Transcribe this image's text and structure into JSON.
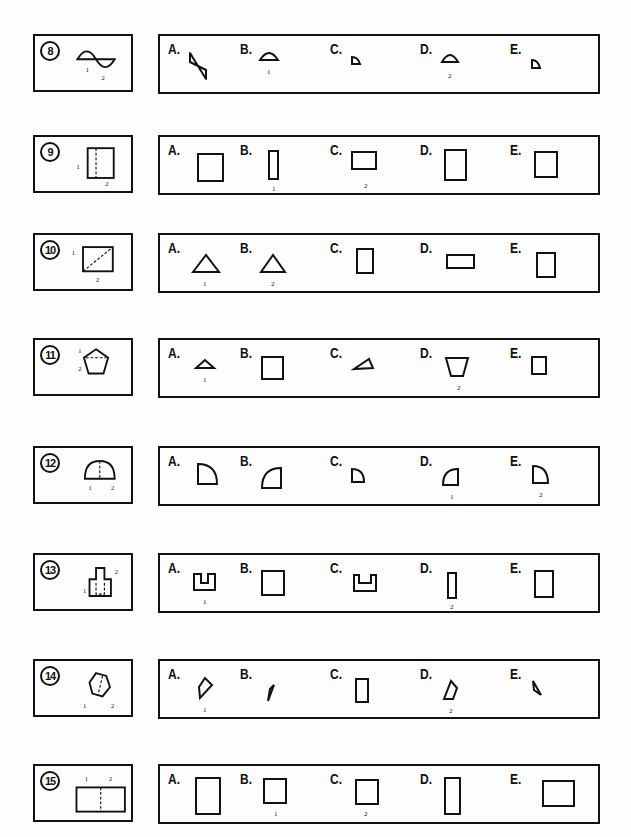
{
  "questions": [
    {
      "number": "8",
      "key_labels": [
        "1",
        "2"
      ],
      "options": [
        {
          "letter": "A.",
          "label": ""
        },
        {
          "letter": "B.",
          "label": "1"
        },
        {
          "letter": "C.",
          "label": ""
        },
        {
          "letter": "D.",
          "label": "2"
        },
        {
          "letter": "E.",
          "label": ""
        }
      ]
    },
    {
      "number": "9",
      "key_labels": [
        "1",
        "2"
      ],
      "options": [
        {
          "letter": "A.",
          "label": ""
        },
        {
          "letter": "B.",
          "label": "1"
        },
        {
          "letter": "C.",
          "label": "2"
        },
        {
          "letter": "D.",
          "label": ""
        },
        {
          "letter": "E.",
          "label": ""
        }
      ]
    },
    {
      "number": "10",
      "key_labels": [
        "1",
        "2"
      ],
      "options": [
        {
          "letter": "A.",
          "label": "1"
        },
        {
          "letter": "B.",
          "label": "2"
        },
        {
          "letter": "C.",
          "label": ""
        },
        {
          "letter": "D.",
          "label": ""
        },
        {
          "letter": "E.",
          "label": ""
        }
      ]
    },
    {
      "number": "11",
      "key_labels": [
        "1",
        "2"
      ],
      "options": [
        {
          "letter": "A.",
          "label": "1"
        },
        {
          "letter": "B.",
          "label": ""
        },
        {
          "letter": "C.",
          "label": ""
        },
        {
          "letter": "D.",
          "label": "2"
        },
        {
          "letter": "E.",
          "label": ""
        }
      ]
    },
    {
      "number": "12",
      "key_labels": [
        "1",
        "2"
      ],
      "options": [
        {
          "letter": "A.",
          "label": ""
        },
        {
          "letter": "B.",
          "label": ""
        },
        {
          "letter": "C.",
          "label": ""
        },
        {
          "letter": "D.",
          "label": "1"
        },
        {
          "letter": "E.",
          "label": "2"
        }
      ]
    },
    {
      "number": "13",
      "key_labels": [
        "1",
        "2"
      ],
      "options": [
        {
          "letter": "A.",
          "label": "1"
        },
        {
          "letter": "B.",
          "label": ""
        },
        {
          "letter": "C.",
          "label": ""
        },
        {
          "letter": "D.",
          "label": "2"
        },
        {
          "letter": "E.",
          "label": ""
        }
      ]
    },
    {
      "number": "14",
      "key_labels": [
        "1",
        "2"
      ],
      "options": [
        {
          "letter": "A.",
          "label": "1"
        },
        {
          "letter": "B.",
          "label": ""
        },
        {
          "letter": "C.",
          "label": ""
        },
        {
          "letter": "D.",
          "label": "2"
        },
        {
          "letter": "E.",
          "label": ""
        }
      ]
    },
    {
      "number": "15",
      "key_labels": [
        "1",
        "2"
      ],
      "options": [
        {
          "letter": "A.",
          "label": ""
        },
        {
          "letter": "B.",
          "label": "1"
        },
        {
          "letter": "C.",
          "label": "2"
        },
        {
          "letter": "D.",
          "label": ""
        },
        {
          "letter": "E.",
          "label": ""
        }
      ]
    }
  ]
}
